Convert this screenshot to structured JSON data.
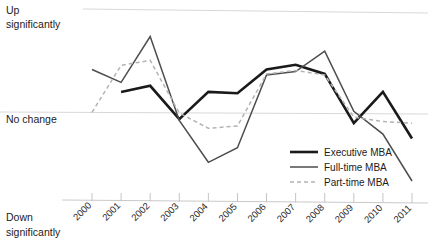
{
  "chart_data": {
    "type": "line",
    "title": "",
    "xlabel": "",
    "ylabel": "",
    "grid": true,
    "legend_position": "inside-right-bottom",
    "x": [
      "2000",
      "2001",
      "2002",
      "2003",
      "2004",
      "2005",
      "2006",
      "2007",
      "2008",
      "2009",
      "2010",
      "2011"
    ],
    "y_axis_labels": {
      "top": "Up significantly",
      "top_line1": "Up",
      "top_line2": "significantly",
      "middle": "No change",
      "bottom": "Down significantly",
      "bottom_line1": "Down",
      "bottom_line2": "significantly"
    },
    "ylim": [
      -3,
      3
    ],
    "y_ticks": [
      3,
      0,
      -3
    ],
    "series": [
      {
        "name": "Executive MBA",
        "color": "#1a1a1a",
        "width": 2.6,
        "dash": "none",
        "values": [
          null,
          0.62,
          0.8,
          -0.18,
          0.62,
          0.58,
          1.28,
          1.42,
          1.15,
          -0.3,
          0.62,
          -0.75
        ]
      },
      {
        "name": "Full-time MBA",
        "color": "#4d4d4d",
        "width": 1.5,
        "dash": "none",
        "values": [
          1.28,
          0.9,
          2.25,
          -0.22,
          -1.45,
          -1.02,
          1.12,
          1.22,
          1.82,
          0.05,
          -0.62,
          -2.0
        ]
      },
      {
        "name": "Part-time MBA",
        "color": "#b3b3b3",
        "width": 1.5,
        "dash": "4,3",
        "values": [
          0.02,
          1.4,
          1.55,
          0.0,
          -0.45,
          -0.38,
          1.15,
          1.25,
          1.12,
          -0.12,
          -0.25,
          -0.3
        ]
      }
    ]
  },
  "legend": {
    "items": [
      {
        "label": "Executive MBA"
      },
      {
        "label": "Full-time MBA"
      },
      {
        "label": "Part-time MBA"
      }
    ]
  }
}
